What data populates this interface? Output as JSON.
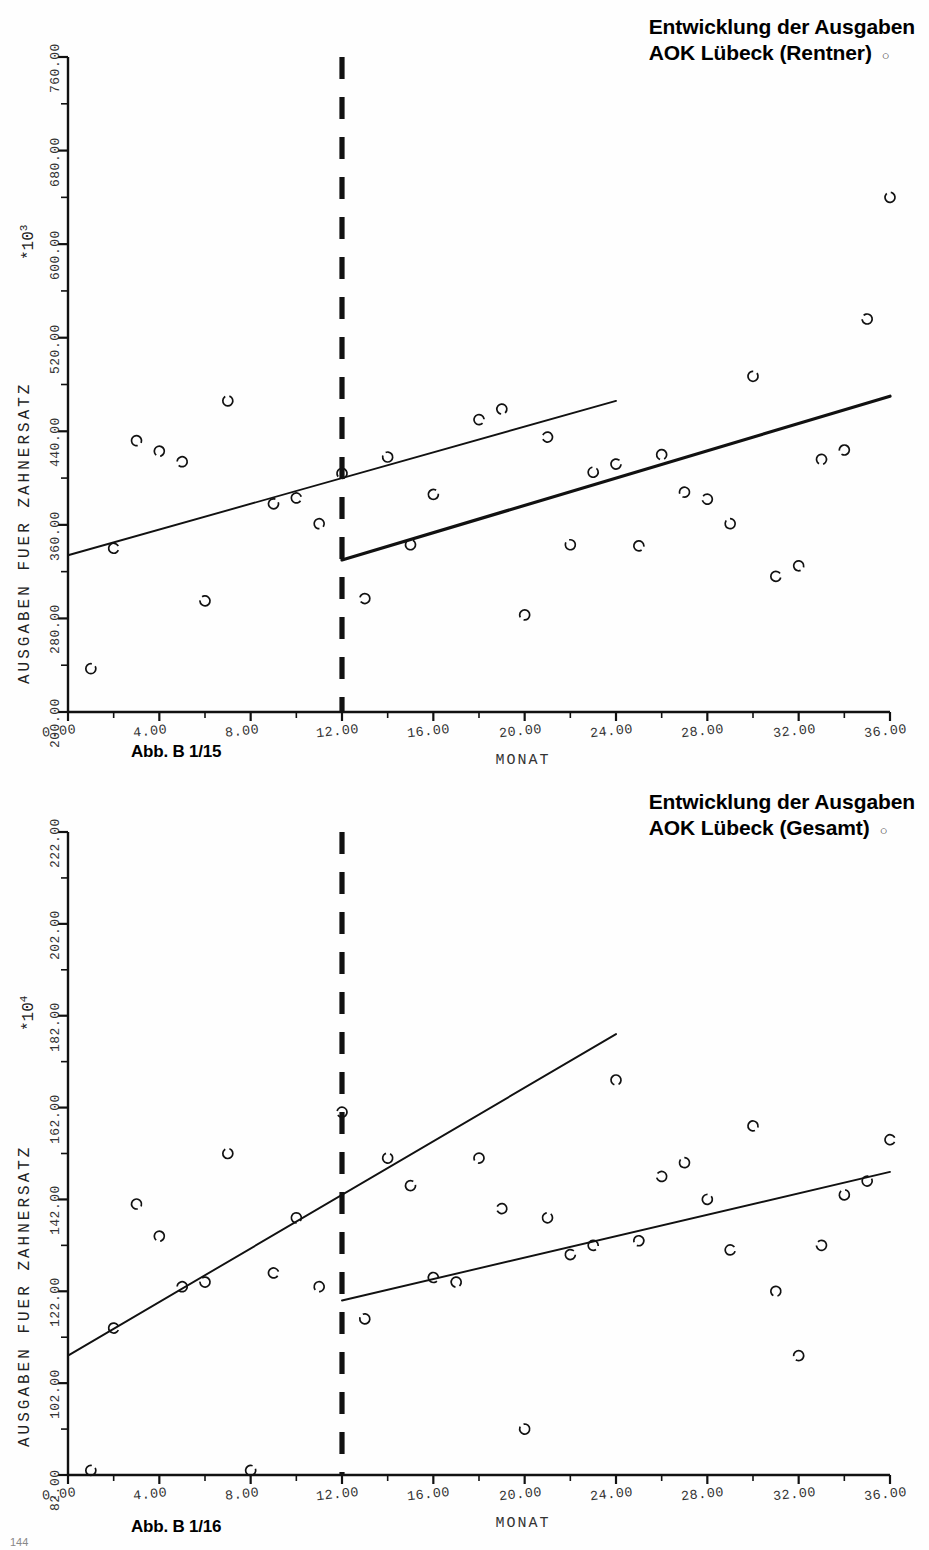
{
  "document": {
    "page_footer": "144"
  },
  "figures": [
    {
      "id": "figure-1",
      "title_line1": "Entwicklung der Ausgaben",
      "title_line2": "AOK Lübeck (Rentner)",
      "title_marker": "○",
      "caption": "Abb. B 1/15",
      "chart_data": {
        "type": "scatter",
        "title": "Entwicklung der Ausgaben AOK Lübeck (Rentner)",
        "xlabel": "MONAT",
        "ylabel": "AUSGABEN FUER ZAHNERSATZ",
        "y_multiplier": "*10",
        "y_multiplier_exp": "3",
        "xlim": [
          0,
          36
        ],
        "ylim": [
          200,
          760
        ],
        "xticks": [
          0,
          2,
          4,
          6,
          8,
          10,
          12,
          14,
          16,
          18,
          20,
          22,
          24,
          26,
          28,
          30,
          32,
          34,
          36
        ],
        "xtick_labels": [
          "0.00",
          "4.00",
          "8.00",
          "12.00",
          "16.00",
          "20.00",
          "24.00",
          "28.00",
          "32.00",
          "36.00"
        ],
        "xtick_label_values": [
          0,
          4,
          8,
          12,
          16,
          20,
          24,
          28,
          32,
          36
        ],
        "yticks": [
          200,
          240,
          280,
          320,
          360,
          400,
          440,
          480,
          520,
          560,
          600,
          640,
          680,
          720,
          760
        ],
        "ytick_labels": [
          "200.00",
          "280.00",
          "360.00",
          "440.00",
          "520.00",
          "600.00",
          "680.00",
          "760.00"
        ],
        "ytick_label_values": [
          200,
          280,
          360,
          440,
          520,
          600,
          680,
          760
        ],
        "grid": false,
        "legend": "none",
        "marker": "open-circle",
        "points": [
          [
            1,
            237
          ],
          [
            2,
            340
          ],
          [
            3,
            432
          ],
          [
            4,
            423
          ],
          [
            5,
            414
          ],
          [
            6,
            295
          ],
          [
            7,
            466
          ],
          [
            9,
            378
          ],
          [
            10,
            383
          ],
          [
            11,
            361
          ],
          [
            12,
            404
          ],
          [
            13,
            297
          ],
          [
            14,
            418
          ],
          [
            15,
            343
          ],
          [
            16,
            386
          ],
          [
            18,
            450
          ],
          [
            19,
            459
          ],
          [
            20,
            283
          ],
          [
            21,
            435
          ],
          [
            22,
            343
          ],
          [
            23,
            405
          ],
          [
            24,
            412
          ],
          [
            25,
            342
          ],
          [
            26,
            420
          ],
          [
            27,
            388
          ],
          [
            28,
            382
          ],
          [
            29,
            361
          ],
          [
            30,
            487
          ],
          [
            31,
            316
          ],
          [
            32,
            325
          ],
          [
            33,
            416
          ],
          [
            34,
            424
          ],
          [
            35,
            536
          ],
          [
            36,
            640
          ]
        ],
        "trend_lines": [
          {
            "name": "pre-intervention-trend",
            "x": [
              0,
              24
            ],
            "y": [
              334,
              466
            ],
            "style": "thin-solid"
          },
          {
            "name": "post-intervention-trend",
            "x": [
              12,
              36
            ],
            "y": [
              330,
              470
            ],
            "style": "thick-solid"
          }
        ],
        "annotations": [
          {
            "name": "intervention-marker",
            "type": "vertical-dashed-line",
            "x": 12,
            "label": ""
          }
        ]
      }
    },
    {
      "id": "figure-2",
      "title_line1": "Entwicklung der Ausgaben",
      "title_line2": "AOK Lübeck (Gesamt)",
      "title_marker": "○",
      "caption": "Abb. B 1/16",
      "chart_data": {
        "type": "scatter",
        "title": "Entwicklung der Ausgaben AOK Lübeck (Gesamt)",
        "xlabel": "MONAT",
        "ylabel": "AUSGABEN FUER ZAHNERSATZ",
        "y_multiplier": "*10",
        "y_multiplier_exp": "4",
        "xlim": [
          0,
          36
        ],
        "ylim": [
          82,
          222
        ],
        "xticks": [
          0,
          2,
          4,
          6,
          8,
          10,
          12,
          14,
          16,
          18,
          20,
          22,
          24,
          26,
          28,
          30,
          32,
          34,
          36
        ],
        "xtick_labels": [
          "0.00",
          "4.00",
          "8.00",
          "12.00",
          "16.00",
          "20.00",
          "24.00",
          "28.00",
          "32.00",
          "36.00"
        ],
        "xtick_label_values": [
          0,
          4,
          8,
          12,
          16,
          20,
          24,
          28,
          32,
          36
        ],
        "yticks": [
          82,
          92,
          102,
          112,
          122,
          132,
          142,
          152,
          162,
          172,
          182,
          192,
          202,
          212,
          222
        ],
        "ytick_labels": [
          "82.00",
          "102.00",
          "122.00",
          "142.00",
          "162.00",
          "182.00",
          "202.00",
          "222.00"
        ],
        "ytick_label_values": [
          82,
          102,
          122,
          142,
          162,
          182,
          202,
          222
        ],
        "grid": false,
        "legend": "none",
        "marker": "open-circle",
        "points": [
          [
            1,
            83
          ],
          [
            2,
            114
          ],
          [
            3,
            141
          ],
          [
            4,
            134
          ],
          [
            5,
            123
          ],
          [
            6,
            124
          ],
          [
            7,
            152
          ],
          [
            8,
            83
          ],
          [
            9,
            126
          ],
          [
            10,
            138
          ],
          [
            11,
            123
          ],
          [
            12,
            161
          ],
          [
            13,
            116
          ],
          [
            14,
            151
          ],
          [
            15,
            145
          ],
          [
            16,
            125
          ],
          [
            17,
            124
          ],
          [
            18,
            151
          ],
          [
            19,
            140
          ],
          [
            20,
            92
          ],
          [
            21,
            138
          ],
          [
            22,
            130
          ],
          [
            23,
            132
          ],
          [
            24,
            168
          ],
          [
            25,
            133
          ],
          [
            26,
            147
          ],
          [
            27,
            150
          ],
          [
            28,
            142
          ],
          [
            29,
            131
          ],
          [
            30,
            158
          ],
          [
            31,
            122
          ],
          [
            32,
            108
          ],
          [
            33,
            132
          ],
          [
            34,
            143
          ],
          [
            35,
            146
          ],
          [
            36,
            155
          ]
        ],
        "trend_lines": [
          {
            "name": "pre-intervention-trend",
            "x": [
              0,
              24
            ],
            "y": [
              108,
              178
            ],
            "style": "thin-solid"
          },
          {
            "name": "post-intervention-trend",
            "x": [
              12,
              36
            ],
            "y": [
              120,
              148
            ],
            "style": "thin-solid"
          }
        ],
        "annotations": [
          {
            "name": "intervention-marker",
            "type": "vertical-dashed-line",
            "x": 12,
            "label": ""
          }
        ]
      }
    }
  ]
}
